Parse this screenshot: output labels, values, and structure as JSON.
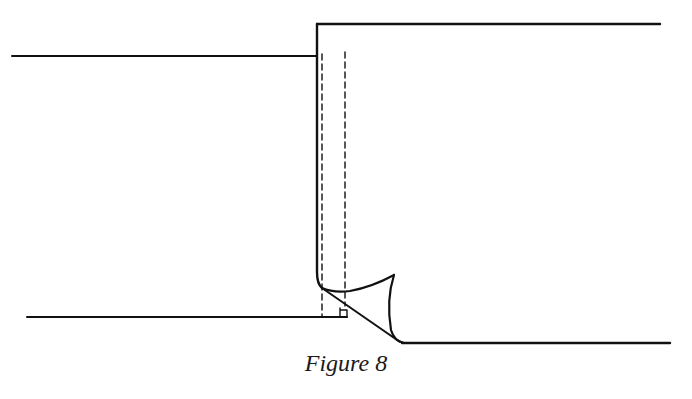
{
  "figure": {
    "caption": "Figure 8",
    "stroke_color": "#111111",
    "background": "#ffffff"
  },
  "diagram": {
    "type": "technical-illustration",
    "elements": [
      {
        "name": "top-left-edge",
        "kind": "line"
      },
      {
        "name": "top-right-edge",
        "kind": "line"
      },
      {
        "name": "fold-vertical-edge",
        "kind": "line"
      },
      {
        "name": "stitch-line-inner",
        "kind": "dashed-line"
      },
      {
        "name": "stitch-line-outer",
        "kind": "dashed-line"
      },
      {
        "name": "folded-corner-flap",
        "kind": "curve"
      },
      {
        "name": "bottom-left-edge",
        "kind": "line"
      },
      {
        "name": "bottom-right-edge",
        "kind": "line"
      },
      {
        "name": "corner-notch",
        "kind": "small-square"
      }
    ]
  }
}
